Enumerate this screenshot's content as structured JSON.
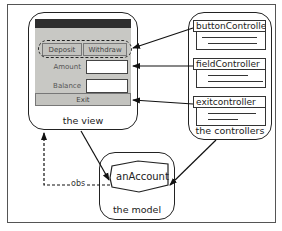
{
  "diagram": {
    "groups": {
      "view": {
        "label": "the view"
      },
      "controllers": {
        "label": "the controllers"
      },
      "model": {
        "label": "the model"
      }
    },
    "window": {
      "buttons": {
        "deposit": "Deposit",
        "withdraw": "Withdraw",
        "exit": "Exit"
      },
      "fields": {
        "amount_label": "Amount",
        "balance_label": "Balance"
      }
    },
    "controllers": [
      {
        "name": "buttonController"
      },
      {
        "name": "fieldController"
      },
      {
        "name": "exitcontroller"
      }
    ],
    "model": {
      "object": "anAccount"
    },
    "edges": [
      {
        "from": "buttonController",
        "to": "Deposit/Withdraw",
        "style": "solid-arrow"
      },
      {
        "from": "fieldController",
        "to": "Amount field",
        "style": "solid-arrow"
      },
      {
        "from": "exitcontroller",
        "to": "Exit",
        "style": "solid-arrow"
      },
      {
        "from": "the view",
        "to": "anAccount",
        "style": "solid-arrow"
      },
      {
        "from": "the controllers",
        "to": "anAccount",
        "style": "solid-arrow"
      },
      {
        "from": "anAccount",
        "to": "the view",
        "style": "dashed-arrow",
        "label": "obs"
      }
    ],
    "obs_label": "obs"
  }
}
